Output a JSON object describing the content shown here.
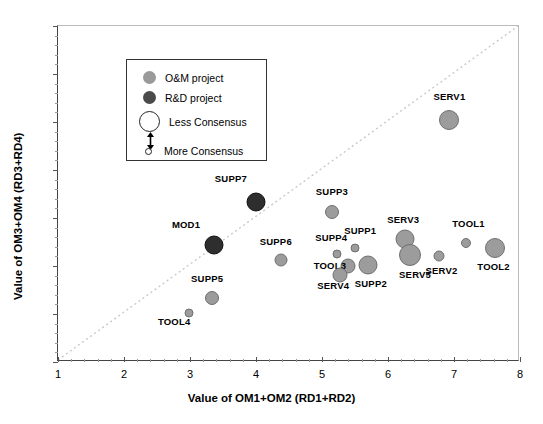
{
  "chart_data": {
    "type": "scatter",
    "title": "",
    "xlabel": "Value of OM1+OM2 (RD1+RD2)",
    "ylabel": "Value of OM3+OM4 (RD3+RD4)",
    "xlim": [
      1,
      8
    ],
    "ylim": [
      1,
      8
    ],
    "xticks": [
      1,
      2,
      3,
      4,
      5,
      6,
      7,
      8
    ],
    "yticks": [
      1,
      2,
      3,
      4,
      5,
      6,
      7,
      8
    ],
    "grid": false,
    "reference_line": {
      "type": "diagonal",
      "from": [
        1,
        1
      ],
      "to": [
        8,
        8
      ],
      "style": "dotted"
    },
    "series": [
      {
        "name": "O&M project",
        "color": "#9a9a9a"
      },
      {
        "name": "R&D project",
        "color": "#3a3a3a"
      }
    ],
    "size_encoding": {
      "large": "Less Consensus",
      "small": "More Consensus"
    },
    "points": [
      {
        "label": "SERV1",
        "x": 6.93,
        "y": 6.05,
        "size": 20,
        "type": "O&M",
        "lx": 6.93,
        "ly": 6.55
      },
      {
        "label": "SUPP7",
        "x": 4.0,
        "y": 4.33,
        "size": 19,
        "type": "R&D",
        "lx": 3.62,
        "ly": 4.83
      },
      {
        "label": "SUPP3",
        "x": 5.15,
        "y": 4.12,
        "size": 14,
        "type": "O&M",
        "lx": 5.15,
        "ly": 4.56
      },
      {
        "label": "MOD1",
        "x": 3.37,
        "y": 3.43,
        "size": 19,
        "type": "R&D",
        "lx": 2.94,
        "ly": 3.88
      },
      {
        "label": "SERV3",
        "x": 6.25,
        "y": 3.57,
        "size": 19,
        "type": "O&M",
        "lx": 6.23,
        "ly": 3.98
      },
      {
        "label": "TOOL1",
        "x": 7.18,
        "y": 3.48,
        "size": 10,
        "type": "O&M",
        "lx": 7.22,
        "ly": 3.9
      },
      {
        "label": "TOOL2",
        "x": 7.62,
        "y": 3.37,
        "size": 20,
        "type": "O&M",
        "lx": 7.6,
        "ly": 3.01
      },
      {
        "label": "SUPP1",
        "x": 5.5,
        "y": 3.38,
        "size": 9,
        "type": "O&M",
        "lx": 5.58,
        "ly": 3.74
      },
      {
        "label": "SUPP4",
        "x": 5.23,
        "y": 3.25,
        "size": 9,
        "type": "O&M",
        "lx": 5.14,
        "ly": 3.6
      },
      {
        "label": "SERV2",
        "x": 6.78,
        "y": 3.2,
        "size": 11,
        "type": "O&M",
        "lx": 6.81,
        "ly": 2.92
      },
      {
        "label": "SERV5",
        "x": 6.33,
        "y": 3.22,
        "size": 22,
        "type": "O&M",
        "lx": 6.41,
        "ly": 2.84
      },
      {
        "label": "TOOL3",
        "x": 5.4,
        "y": 2.99,
        "size": 15,
        "type": "O&M",
        "lx": 5.12,
        "ly": 3.02
      },
      {
        "label": "SERV4",
        "x": 5.27,
        "y": 2.82,
        "size": 15,
        "type": "O&M",
        "lx": 5.17,
        "ly": 2.6
      },
      {
        "label": "SUPP2",
        "x": 5.7,
        "y": 3.02,
        "size": 19,
        "type": "O&M",
        "lx": 5.74,
        "ly": 2.64
      },
      {
        "label": "SUPP6",
        "x": 4.38,
        "y": 3.12,
        "size": 13,
        "type": "O&M",
        "lx": 4.3,
        "ly": 3.52
      },
      {
        "label": "SUPP5",
        "x": 3.33,
        "y": 2.34,
        "size": 14,
        "type": "O&M",
        "lx": 3.26,
        "ly": 2.76
      },
      {
        "label": "TOOL4",
        "x": 2.99,
        "y": 2.02,
        "size": 9,
        "type": "O&M",
        "lx": 2.76,
        "ly": 1.86
      }
    ]
  },
  "legend": {
    "items": [
      {
        "label": "O&M project",
        "marker": "dot-light",
        "color": "#9a9a9a"
      },
      {
        "label": "R&D project",
        "marker": "dot-dark",
        "color": "#4a4a4a"
      },
      {
        "label": "Less Consensus",
        "marker": "circle-large-open"
      },
      {
        "label": "More Consensus",
        "marker": "circle-small-open"
      }
    ]
  }
}
